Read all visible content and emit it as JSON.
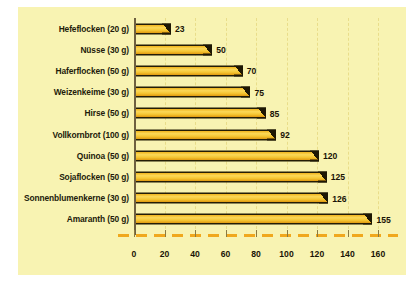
{
  "chart_data": {
    "type": "bar",
    "orientation": "horizontal",
    "title": "",
    "subtitle": "",
    "xlabel": "",
    "ylabel": "",
    "xlim": [
      0,
      160
    ],
    "xticks": [
      0,
      20,
      40,
      60,
      80,
      100,
      120,
      140,
      160
    ],
    "grid": true,
    "legend": false,
    "categories": [
      "Hefeflocken (20 g)",
      "Nüsse (30 g)",
      "Haferflocken (50 g)",
      "Weizenkeime (30 g)",
      "Hirse (50 g)",
      "Vollkornbrot (100 g)",
      "Quinoa (50 g)",
      "Sojaflocken (50 g)",
      "Sonnenblumenkerne (30 g)",
      "Amaranth (50 g)"
    ],
    "values": [
      23,
      50,
      70,
      75,
      85,
      92,
      120,
      125,
      126,
      155
    ],
    "value_labels": [
      "23",
      "50",
      "70",
      "75",
      "85",
      "92",
      "120",
      "125",
      "126",
      "155"
    ],
    "colors": {
      "panel_background": "#f8f3b2",
      "page_background": "#ffffff",
      "bar_fill": "#f5c633",
      "bar_highlight": "#fbd858",
      "bar_edge": "#241d05",
      "baseline_dashed": "#f0a81e",
      "gridline": "#e9dd8a",
      "axis": "#6e6040",
      "text": "#231b0a"
    }
  }
}
